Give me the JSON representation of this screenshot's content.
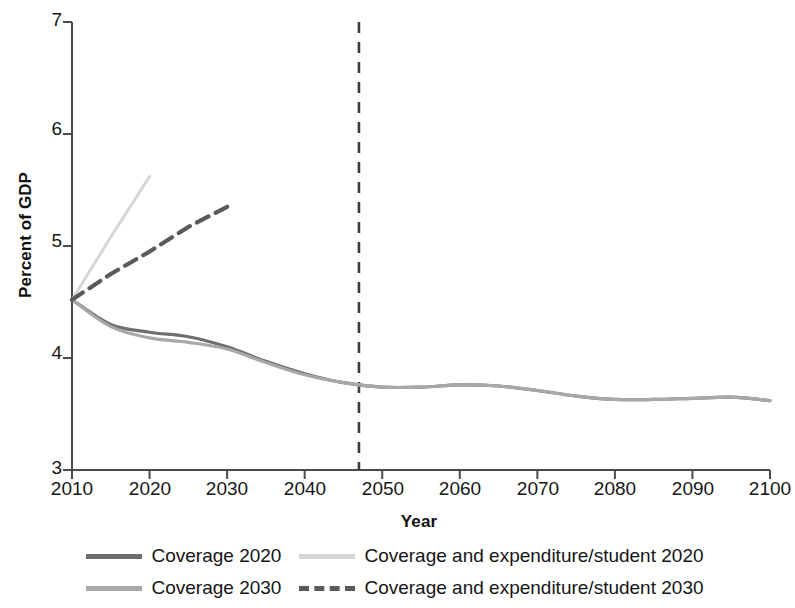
{
  "chart_data": {
    "type": "line",
    "title": "",
    "xlabel": "Year",
    "ylabel": "Percent of GDP",
    "xlim": [
      2010,
      2100
    ],
    "ylim": [
      3,
      7
    ],
    "xticks": [
      2010,
      2020,
      2030,
      2040,
      2050,
      2060,
      2070,
      2080,
      2090,
      2100
    ],
    "yticks": [
      3,
      4,
      5,
      6,
      7
    ],
    "grid": false,
    "legend_position": "bottom",
    "annotations": [
      {
        "name": "projection-divider",
        "type": "vertical-line",
        "x": 2047,
        "style": "dashed",
        "color": "#3c3c3c"
      }
    ],
    "x": [
      2010,
      2015,
      2020,
      2025,
      2030,
      2035,
      2040,
      2045,
      2050,
      2055,
      2060,
      2065,
      2070,
      2075,
      2080,
      2085,
      2090,
      2095,
      2100
    ],
    "series": [
      {
        "name": "Coverage 2020",
        "color": "#6e6e6e",
        "style": "solid",
        "width": 3.2,
        "values": [
          4.52,
          4.3,
          4.23,
          4.19,
          4.1,
          3.97,
          3.86,
          3.78,
          3.74,
          3.74,
          3.76,
          3.75,
          3.71,
          3.66,
          3.63,
          3.63,
          3.64,
          3.65,
          3.62
        ]
      },
      {
        "name": "Coverage 2030",
        "color": "#a8a8a8",
        "style": "solid",
        "width": 3.2,
        "values": [
          4.52,
          4.28,
          4.18,
          4.14,
          4.08,
          3.96,
          3.85,
          3.78,
          3.74,
          3.74,
          3.76,
          3.75,
          3.71,
          3.66,
          3.63,
          3.63,
          3.64,
          3.65,
          3.62
        ]
      },
      {
        "name": "Coverage and expenditure/student 2020",
        "color": "#d6d6d6",
        "style": "solid",
        "width": 3.0,
        "values": [
          4.52,
          5.08,
          5.62,
          5.49,
          5.35,
          5.18,
          5.02,
          4.92,
          4.89,
          4.9,
          4.92,
          4.91,
          4.87,
          4.8,
          4.74,
          4.74,
          4.77,
          4.78,
          4.75
        ]
      },
      {
        "name": "Coverage and expenditure/student 2030",
        "color": "#5a5a5a",
        "style": "dashed",
        "width": 4.2,
        "values": [
          4.52,
          4.75,
          4.95,
          5.17,
          5.35,
          5.18,
          5.02,
          4.92,
          4.89,
          4.9,
          4.92,
          4.91,
          4.87,
          4.8,
          4.74,
          4.74,
          4.77,
          4.78,
          4.75
        ]
      }
    ],
    "legend": [
      {
        "label": "Coverage 2020",
        "color": "#6e6e6e",
        "style": "solid"
      },
      {
        "label": "Coverage and expenditure/student 2020",
        "color": "#d6d6d6",
        "style": "solid"
      },
      {
        "label": "Coverage 2030",
        "color": "#a8a8a8",
        "style": "solid"
      },
      {
        "label": "Coverage and expenditure/student 2030",
        "color": "#5a5a5a",
        "style": "dashed"
      }
    ]
  },
  "axis": {
    "x_title": "Year",
    "y_title": "Percent of GDP",
    "y_tick_labels": [
      "7",
      "6",
      "5",
      "4",
      "3"
    ],
    "x_tick_labels": [
      "2010",
      "2020",
      "2030",
      "2040",
      "2050",
      "2060",
      "2070",
      "2080",
      "2090",
      "2100"
    ]
  },
  "legend": {
    "row1_left": "Coverage 2020",
    "row1_right": "Coverage and expenditure/student 2020",
    "row2_left": "Coverage 2030",
    "row2_right": "Coverage and expenditure/student 2030"
  },
  "colors": {
    "axis": "#4a4a4a",
    "coverage_2020": "#6e6e6e",
    "coverage_2030": "#a8a8a8",
    "cov_exp_2020": "#d6d6d6",
    "cov_exp_2030": "#5a5a5a",
    "divider": "#3c3c3c"
  }
}
